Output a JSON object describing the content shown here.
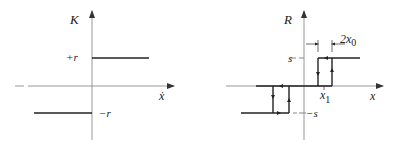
{
  "left_plot": {
    "y_label": "K",
    "x_label": "ẋ",
    "pos_level_label": "+r",
    "neg_level_label": "−r"
  },
  "right_plot": {
    "y_label": "R",
    "x_label": "x",
    "pos_level_label": "s",
    "neg_level_label": "−s",
    "offset_label": "x",
    "offset_sub": "1",
    "width_label": "2x",
    "width_sub": "0"
  }
}
